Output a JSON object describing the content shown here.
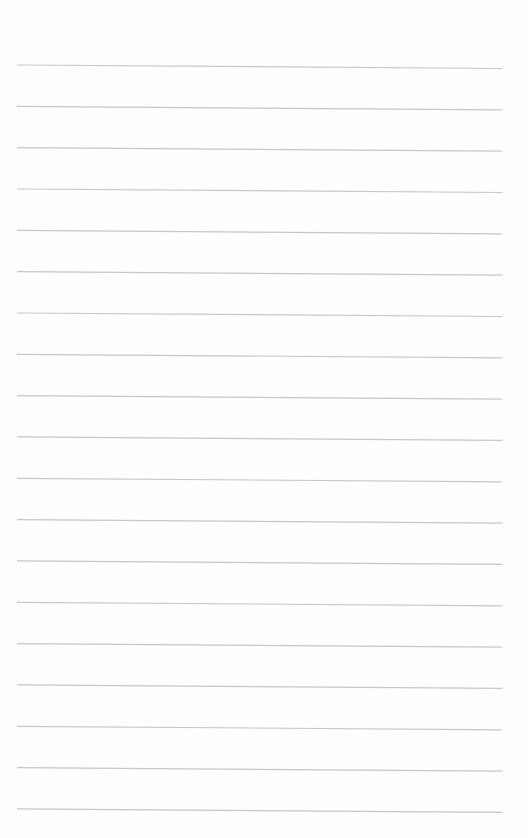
{
  "page": {
    "type": "blank-lined-sheet",
    "background_color": "#fefefe",
    "line_color": "#c6c6c6",
    "line_count": 19,
    "line_start_x": 17,
    "line_end_x": 502,
    "first_line_y": 65,
    "line_spacing": 41.33,
    "line_slope_px": 3.5
  }
}
